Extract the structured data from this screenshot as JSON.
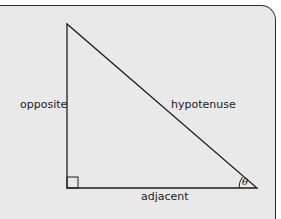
{
  "diagram": {
    "labels": {
      "opposite": "opposite",
      "hypotenuse": "hypotenuse",
      "adjacent": "adjacent",
      "angle": "θ"
    },
    "colors": {
      "background": "#e9e9e9",
      "stroke": "#1e1e1e",
      "text": "#222222"
    }
  }
}
